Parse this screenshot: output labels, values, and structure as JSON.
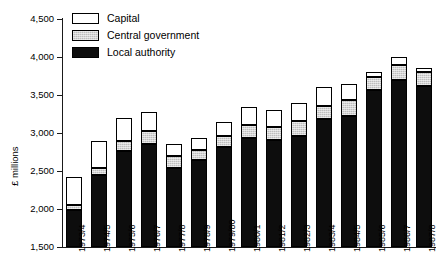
{
  "chart_data": {
    "type": "bar",
    "subtype": "stacked-vertical",
    "title": "",
    "xlabel": "",
    "ylabel": "£ millions",
    "ylim": [
      1500,
      4500
    ],
    "yticks": [
      1500,
      2000,
      2500,
      3000,
      3500,
      4000,
      4500
    ],
    "ytick_labels": [
      "1,500",
      "2,000",
      "2,500",
      "3,000",
      "3,500",
      "4,000",
      "4,500"
    ],
    "grid": false,
    "legend_position": "top-left-inside",
    "categories": [
      "1973/4",
      "1974/5",
      "1975/6",
      "1976/7",
      "1977/8",
      "1978/9",
      "1979/80",
      "1980/1",
      "1981/2",
      "1982/3",
      "1983/4",
      "1984/5",
      "1985/6",
      "1986/7",
      "1987/8"
    ],
    "series": [
      {
        "name": "Local authority",
        "color": "#0d0d0d",
        "values": [
          1990,
          2450,
          2760,
          2860,
          2540,
          2640,
          2820,
          2930,
          2910,
          2960,
          3190,
          3230,
          3560,
          3700,
          3620
        ]
      },
      {
        "name": "Central government",
        "color": "#bdbdbd",
        "values": [
          60,
          90,
          130,
          170,
          160,
          130,
          140,
          170,
          170,
          200,
          170,
          210,
          180,
          190,
          180
        ]
      },
      {
        "name": "Capital",
        "color": "#ffffff",
        "values": [
          370,
          350,
          310,
          250,
          150,
          160,
          190,
          240,
          220,
          230,
          240,
          210,
          60,
          110,
          60
        ]
      }
    ],
    "totals": [
      2420,
      2890,
      3200,
      3280,
      2850,
      2930,
      3150,
      3340,
      3300,
      3390,
      3600,
      3650,
      3800,
      4000,
      3860
    ]
  },
  "legend": {
    "items": [
      {
        "label": "Capital",
        "swatch": "capital"
      },
      {
        "label": "Central government",
        "swatch": "central"
      },
      {
        "label": "Local authority",
        "swatch": "local"
      }
    ]
  },
  "colors": {
    "axis": "#1a1a1a",
    "local_authority": "#0d0d0d",
    "central_government": "#bdbdbd",
    "capital": "#ffffff",
    "background": "#ffffff"
  }
}
